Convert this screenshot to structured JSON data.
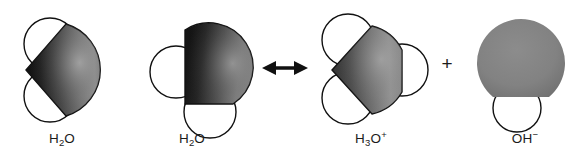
{
  "figure": {
    "type": "molecular-space-filling-diagram",
    "background_color": "#ffffff",
    "outline_color": "#111111",
    "molecules": [
      {
        "id": "water-left",
        "label_html": "H<sub>2</sub>O",
        "label_text": "H2O",
        "formula": "H2O",
        "center_x": 78,
        "center_y": 68,
        "oxygen_color_dark": "#1a1a1a",
        "oxygen_color_light": "#9a9a9a",
        "hydrogen_color": "#ffffff",
        "hydrogen_count": 2,
        "hydrogen_positions": [
          "upper-left",
          "lower-left"
        ],
        "charge": ""
      },
      {
        "id": "water-right",
        "label_html": "H<sub>2</sub>O",
        "label_text": "H2O",
        "formula": "H2O",
        "center_x": 206,
        "center_y": 72,
        "oxygen_color_dark": "#1f1f1f",
        "oxygen_color_light": "#8f8f8f",
        "hydrogen_color": "#ffffff",
        "hydrogen_count": 2,
        "hydrogen_positions": [
          "left",
          "bottom"
        ],
        "charge": ""
      },
      {
        "id": "hydronium",
        "label_html": "H<sub>3</sub>O<sup>+</sup>",
        "label_text": "H3O+",
        "formula": "H3O",
        "center_x": 374,
        "center_y": 68,
        "oxygen_color_dark": "#3c3c3c",
        "oxygen_color_light": "#9e9e9e",
        "hydrogen_color": "#ffffff",
        "hydrogen_count": 3,
        "hydrogen_positions": [
          "upper-left",
          "lower-left",
          "right"
        ],
        "charge": "+"
      },
      {
        "id": "hydroxide",
        "label_html": "OH<sup>−</sup>",
        "label_text": "OH-",
        "formula": "OH",
        "center_x": 524,
        "center_y": 62,
        "oxygen_color_dark": "#6f6f6f",
        "oxygen_color_light": "#8b8b8b",
        "hydrogen_color": "#ffffff",
        "hydrogen_count": 1,
        "hydrogen_positions": [
          "bottom"
        ],
        "charge": "−"
      }
    ],
    "symbols": [
      {
        "id": "resonance-arrow",
        "name": "double-headed-arrow",
        "glyph": "↔",
        "x": 285,
        "y": 68,
        "color": "#111111"
      },
      {
        "id": "plus-operator",
        "name": "plus-sign",
        "glyph": "+",
        "x": 447,
        "y": 63,
        "color": "#1b1b1b"
      }
    ]
  },
  "labels": {
    "water_left": "H2O",
    "water_right": "H2O",
    "hydronium": "H3O+",
    "hydroxide": "OH-",
    "plus": "+"
  }
}
